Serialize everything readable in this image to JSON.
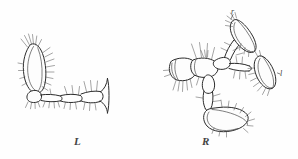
{
  "figure": {
    "type": "scientific-line-engraving",
    "background_color": "#fefefe",
    "ink_color": "#2b2b2b",
    "width": 298,
    "height": 159,
    "panels": [
      {
        "id": "left-limb",
        "label": "L",
        "label_position": {
          "x": 74,
          "y": 136
        },
        "bounds": {
          "x": 8,
          "y": 34,
          "width": 100,
          "height": 78
        },
        "description": "Left limb shown in lateral view with a large elongate oval terminal segment bearing marginal bristles at upper left, and a chain of articulated podomeres extending to the right ending in a forked distal segment."
      },
      {
        "id": "right-limb",
        "label": "R",
        "label_position": {
          "x": 202,
          "y": 136
        },
        "bounds": {
          "x": 168,
          "y": 10,
          "width": 120,
          "height": 122
        },
        "description": "Right limb shown spread, with a broad basal segment at left and three elongate oval distal segments radiating upward, rightward and downward, each fringed with setae."
      }
    ],
    "callouts": [
      {
        "id": "callout-r",
        "label": "r",
        "position": {
          "x": 231,
          "y": 8
        },
        "points_to": "upper oval claw segment of right limb"
      },
      {
        "id": "callout-l",
        "label": "l",
        "position": {
          "x": 280,
          "y": 70
        },
        "points_to": "lateral oval claw segment of right limb"
      }
    ]
  }
}
